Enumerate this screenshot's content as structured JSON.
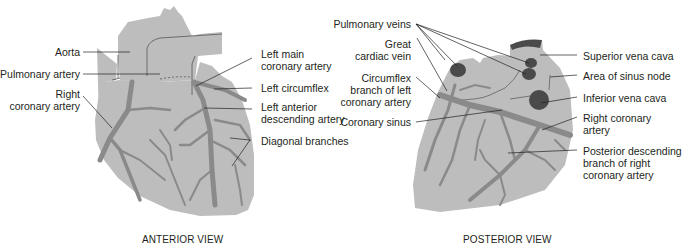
{
  "colors": {
    "heart_fill": "#bdbdbd",
    "vessel": "#8a8a8a",
    "outline": "#555555",
    "vein_dark": "#4a4a4a",
    "leader": "#231f20",
    "text": "#231f20"
  },
  "anterior": {
    "caption": "ANTERIOR VIEW",
    "labels": {
      "aorta": "Aorta",
      "pulmonary_artery": "Pulmonary artery",
      "right_coronary_l1": "Right",
      "right_coronary_l2": "coronary artery",
      "left_main_l1": "Left main",
      "left_main_l2": "coronary artery",
      "left_circumflex": "Left circumflex",
      "lad_l1": "Left anterior",
      "lad_l2": "descending artery",
      "diagonal": "Diagonal branches"
    }
  },
  "posterior": {
    "caption": "POSTERIOR VIEW",
    "labels": {
      "pulmonary_veins": "Pulmonary veins",
      "great_cardiac_l1": "Great",
      "great_cardiac_l2": "cardiac vein",
      "circumflex_l1": "Circumflex",
      "circumflex_l2": "branch of left",
      "circumflex_l3": "coronary artery",
      "coronary_sinus": "Coronary sinus",
      "svc": "Superior vena cava",
      "sinus_node": "Area of sinus node",
      "ivc": "Inferior vena cava",
      "rca_l1": "Right coronary",
      "rca_l2": "artery",
      "pdb_l1": "Posterior descending",
      "pdb_l2": "branch of right",
      "pdb_l3": "coronary artery"
    }
  }
}
